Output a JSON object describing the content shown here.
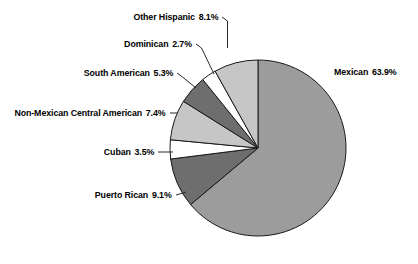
{
  "chart_data": {
    "type": "pie",
    "title": "",
    "subtitle": "",
    "xlabel": "",
    "ylabel": "",
    "legend_position": "callout-labels",
    "grid": false,
    "units": "percent",
    "start_angle_deg": 0,
    "direction": "clockwise",
    "categories": [
      "Mexican",
      "Puerto Rican",
      "Cuban",
      "Non-Mexican Central American",
      "South American",
      "Dominican",
      "Other Hispanic"
    ],
    "values": [
      63.9,
      9.1,
      3.5,
      7.4,
      5.3,
      2.7,
      8.1
    ],
    "value_labels": [
      "63.9%",
      "9.1%",
      "3.5%",
      "7.4%",
      "5.3%",
      "2.7%",
      "8.1%"
    ],
    "slice_colors": [
      "#9c9c9c",
      "#6e6e6e",
      "#ffffff",
      "#c6c6c6",
      "#6e6e6e",
      "#ffffff",
      "#c6c6c6"
    ],
    "slice_outline_color": "#1a1a1a",
    "background_color": "#ffffff",
    "text_color": "#000000",
    "slices": [
      {
        "label": "Mexican",
        "value": 63.9,
        "value_label": "63.9%",
        "color": "#9c9c9c",
        "side": "right"
      },
      {
        "label": "Puerto Rican",
        "value": 9.1,
        "value_label": "9.1%",
        "color": "#6e6e6e",
        "side": "left"
      },
      {
        "label": "Cuban",
        "value": 3.5,
        "value_label": "3.5%",
        "color": "#ffffff",
        "side": "left"
      },
      {
        "label": "Non-Mexican Central American",
        "value": 7.4,
        "value_label": "7.4%",
        "color": "#c6c6c6",
        "side": "left"
      },
      {
        "label": "South American",
        "value": 5.3,
        "value_label": "5.3%",
        "color": "#6e6e6e",
        "side": "left"
      },
      {
        "label": "Dominican",
        "value": 2.7,
        "value_label": "2.7%",
        "color": "#ffffff",
        "side": "left"
      },
      {
        "label": "Other Hispanic",
        "value": 8.1,
        "value_label": "8.1%",
        "color": "#c6c6c6",
        "side": "left"
      }
    ]
  },
  "labels": {
    "other_hispanic": {
      "name": "Other Hispanic",
      "pct": "8.1%"
    },
    "dominican": {
      "name": "Dominican",
      "pct": "2.7%"
    },
    "south_american": {
      "name": "South American",
      "pct": "5.3%"
    },
    "non_mex_central": {
      "name": "Non-Mexican Central American",
      "pct": "7.4%"
    },
    "cuban": {
      "name": "Cuban",
      "pct": "3.5%"
    },
    "puerto_rican": {
      "name": "Puerto Rican",
      "pct": "9.1%"
    },
    "mexican": {
      "name": "Mexican",
      "pct": "63.9%"
    }
  }
}
